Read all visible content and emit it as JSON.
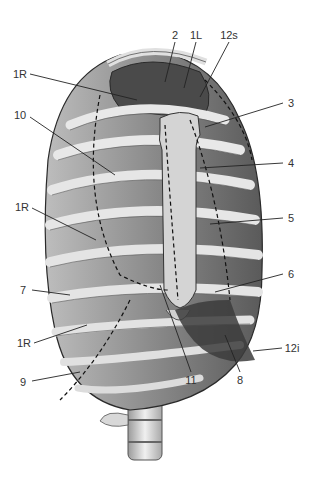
{
  "figure": {
    "colors": {
      "rib_light": "#e6e6e6",
      "rib_mid": "#c8c8c8",
      "intercostal_dark": "#6e6e6e",
      "interior_dark": "#4a4a4a",
      "outline": "#2a2a2a",
      "leader": "#222222",
      "label_text": "#333333"
    },
    "labels": [
      {
        "id": "2",
        "text": "2",
        "x": 175,
        "y": 35,
        "tx": 165,
        "ty": 82
      },
      {
        "id": "1L",
        "text": "1L",
        "x": 196,
        "y": 35,
        "tx": 184,
        "ty": 88
      },
      {
        "id": "12s",
        "text": "12s",
        "x": 229,
        "y": 35,
        "tx": 200,
        "ty": 97
      },
      {
        "id": "1R-a",
        "text": "1R",
        "x": 20,
        "y": 74,
        "tx": 137,
        "ty": 100
      },
      {
        "id": "10",
        "text": "10",
        "x": 20,
        "y": 115,
        "tx": 115,
        "ty": 175
      },
      {
        "id": "3",
        "text": "3",
        "x": 291,
        "y": 103,
        "tx": 205,
        "ty": 127
      },
      {
        "id": "4",
        "text": "4",
        "x": 291,
        "y": 163,
        "tx": 200,
        "ty": 168
      },
      {
        "id": "1R-b",
        "text": "1R",
        "x": 22,
        "y": 207,
        "tx": 96,
        "ty": 240
      },
      {
        "id": "5",
        "text": "5",
        "x": 291,
        "y": 218,
        "tx": 210,
        "ty": 224
      },
      {
        "id": "6",
        "text": "6",
        "x": 291,
        "y": 274,
        "tx": 215,
        "ty": 292
      },
      {
        "id": "7",
        "text": "7",
        "x": 23,
        "y": 290,
        "tx": 70,
        "ty": 295
      },
      {
        "id": "1R-c",
        "text": "1R",
        "x": 24,
        "y": 343,
        "tx": 87,
        "ty": 325
      },
      {
        "id": "12i",
        "text": "12i",
        "x": 292,
        "y": 348,
        "tx": 253,
        "ty": 351
      },
      {
        "id": "11",
        "text": "11",
        "x": 191,
        "y": 380,
        "tx": 160,
        "ty": 285
      },
      {
        "id": "8",
        "text": "8",
        "x": 240,
        "y": 380,
        "tx": 225,
        "ty": 335
      },
      {
        "id": "9",
        "text": "9",
        "x": 23,
        "y": 382,
        "tx": 80,
        "ty": 372
      }
    ]
  }
}
